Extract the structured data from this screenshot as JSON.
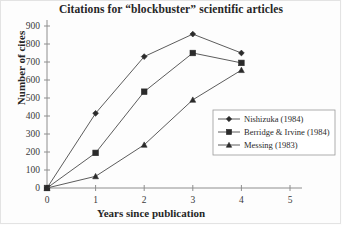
{
  "chart_data": {
    "type": "line",
    "title": "Citations for “blockbuster” scientific articles",
    "xlabel": "Years since publication",
    "ylabel": "Number of cites",
    "x": [
      0,
      1,
      2,
      3,
      4
    ],
    "xlim": [
      0,
      5
    ],
    "ylim": [
      0,
      900
    ],
    "xticks": [
      "0",
      "1",
      "2",
      "3",
      "4",
      "5"
    ],
    "yticks": [
      "0",
      "100",
      "200",
      "300",
      "400",
      "500",
      "600",
      "700",
      "800",
      "900"
    ],
    "grid": false,
    "legend_position": "center-right",
    "series": [
      {
        "name": "Nishizuka (1984)",
        "marker": "diamond",
        "values": [
          0,
          415,
          730,
          855,
          750
        ]
      },
      {
        "name": "Berridge & Irvine (1984)",
        "marker": "square",
        "values": [
          0,
          195,
          535,
          750,
          695
        ]
      },
      {
        "name": "Messing (1983)",
        "marker": "triangle",
        "values": [
          0,
          65,
          240,
          490,
          655
        ]
      }
    ],
    "colors": {
      "line": "#4a4a4a",
      "marker": "#2b2b2b",
      "axis": "#8e8e8e",
      "text": "#262626",
      "background": "#fdfdfd"
    }
  }
}
